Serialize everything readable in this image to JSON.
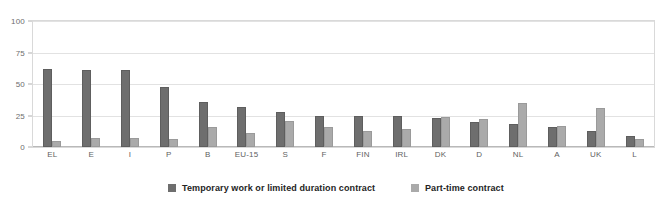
{
  "chart_data": {
    "type": "bar",
    "title": "",
    "subtitle": "",
    "xlabel": "",
    "ylabel": "",
    "ylim": [
      0,
      100
    ],
    "yticks": [
      0,
      25,
      50,
      75,
      100
    ],
    "grid": true,
    "legend_position": "bottom",
    "categories": [
      "EL",
      "E",
      "I",
      "P",
      "B",
      "EU-15",
      "S",
      "F",
      "FIN",
      "IRL",
      "DK",
      "D",
      "NL",
      "A",
      "UK",
      "L"
    ],
    "series": [
      {
        "name": "Temporary work or limited duration contract",
        "color": "#6e6e6e",
        "values": [
          62,
          61,
          61,
          48,
          36,
          32,
          28,
          25,
          25,
          25,
          23,
          20,
          18,
          16,
          13,
          9
        ]
      },
      {
        "name": "Part-time contract",
        "color": "#aaaaaa",
        "values": [
          5,
          7,
          7,
          6,
          16,
          11,
          21,
          16,
          13,
          14,
          24,
          22,
          35,
          17,
          31,
          6
        ]
      }
    ]
  },
  "axis": {
    "y_tick_labels": [
      "0",
      "25",
      "50",
      "75",
      "100"
    ]
  },
  "legend": {
    "entries": [
      {
        "label": "Temporary work or limited duration contract"
      },
      {
        "label": "Part-time contract"
      }
    ]
  },
  "colors": {
    "series_temporary": "#6e6e6e",
    "series_parttime": "#aaaaaa",
    "gridline": "#e2e2e2",
    "frame": "#d9d9d9",
    "background": "#ffffff"
  }
}
